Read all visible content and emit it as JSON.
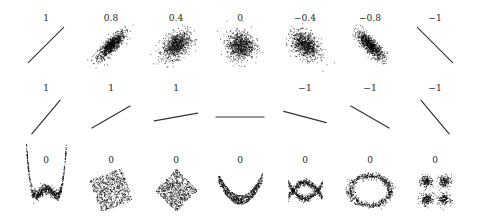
{
  "chart_data": {
    "type": "scatter",
    "title": "",
    "grid": false,
    "axes_visible": false,
    "rows": [
      {
        "row": 1,
        "caption": "Noisy linear relationships with varying correlation",
        "panels": [
          {
            "label": "1",
            "r": 1,
            "shape": "line",
            "slope_deg": 45,
            "spread": 0.0
          },
          {
            "label": "0.8",
            "r": 0.8,
            "shape": "ellipse",
            "slope_deg": 45,
            "spread": 0.35
          },
          {
            "label": "0.4",
            "r": 0.4,
            "shape": "ellipse",
            "slope_deg": 45,
            "spread": 0.65
          },
          {
            "label": "0",
            "r": 0,
            "shape": "ellipse",
            "slope_deg": 0,
            "spread": 1.0
          },
          {
            "label": "−0.4",
            "r": -0.4,
            "shape": "ellipse",
            "slope_deg": -45,
            "spread": 0.65
          },
          {
            "label": "−0.8",
            "r": -0.8,
            "shape": "ellipse",
            "slope_deg": -45,
            "spread": 0.35
          },
          {
            "label": "−1",
            "r": -1,
            "shape": "line",
            "slope_deg": -45,
            "spread": 0.0
          }
        ]
      },
      {
        "row": 2,
        "caption": "Perfect linear relationships with varying slope",
        "panels": [
          {
            "label": "1",
            "r": 1,
            "shape": "line",
            "slope_deg": 50
          },
          {
            "label": "1",
            "r": 1,
            "shape": "line",
            "slope_deg": 30
          },
          {
            "label": "1",
            "r": 1,
            "shape": "line",
            "slope_deg": 10
          },
          {
            "label": "",
            "r": null,
            "shape": "line",
            "slope_deg": 0
          },
          {
            "label": "−1",
            "r": -1,
            "shape": "line",
            "slope_deg": -15
          },
          {
            "label": "−1",
            "r": -1,
            "shape": "line",
            "slope_deg": -30
          },
          {
            "label": "−1",
            "r": -1,
            "shape": "line",
            "slope_deg": -50
          }
        ]
      },
      {
        "row": 3,
        "caption": "Nonlinear relationships with zero correlation",
        "panels": [
          {
            "label": "0",
            "r": 0,
            "shape": "w-curve"
          },
          {
            "label": "0",
            "r": 0,
            "shape": "rotated-square"
          },
          {
            "label": "0",
            "r": 0,
            "shape": "diamond"
          },
          {
            "label": "0",
            "r": 0,
            "shape": "parabola"
          },
          {
            "label": "0",
            "r": 0,
            "shape": "x-cross"
          },
          {
            "label": "0",
            "r": 0,
            "shape": "ring"
          },
          {
            "label": "0",
            "r": 0,
            "shape": "four-clusters"
          }
        ]
      }
    ],
    "point_color": "#000000"
  }
}
